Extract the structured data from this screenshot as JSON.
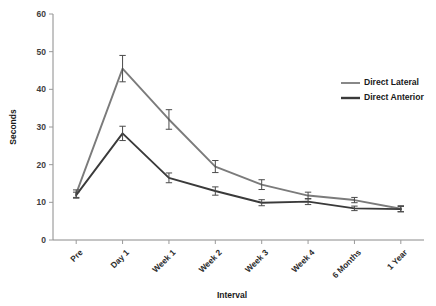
{
  "chart_data": {
    "type": "line",
    "title": "",
    "xlabel": "Interval",
    "ylabel": "Seconds",
    "categories": [
      "Pre",
      "Day 1",
      "Week 1",
      "Week 2",
      "Week 3",
      "Week 4",
      "6 Months",
      "1 Year"
    ],
    "ylim": [
      0,
      60
    ],
    "yticks": [
      0,
      10,
      20,
      30,
      40,
      50,
      60
    ],
    "ytick_labels": [
      "0",
      "10",
      "20",
      "30",
      "40",
      "50",
      "60"
    ],
    "grid": false,
    "legend_position": "right-top",
    "series": [
      {
        "name": "Direct Lateral",
        "color": "#7b7b7b",
        "values": [
          12.3,
          45.5,
          32.0,
          19.5,
          14.7,
          11.8,
          10.6,
          8.3
        ],
        "errors": [
          1.0,
          3.5,
          2.6,
          1.6,
          1.3,
          0.9,
          0.7,
          0.8
        ]
      },
      {
        "name": "Direct Anterior",
        "color": "#3a3a3a",
        "values": [
          11.9,
          28.3,
          16.5,
          13.0,
          9.9,
          10.2,
          8.4,
          8.2
        ],
        "errors": [
          0.8,
          1.9,
          1.3,
          1.1,
          0.8,
          0.8,
          0.6,
          0.7
        ]
      }
    ]
  },
  "legend": {
    "items": [
      {
        "label": "Direct Lateral"
      },
      {
        "label": "Direct Anterior"
      }
    ]
  },
  "axes": {
    "y_title": "Seconds",
    "x_title": "Interval"
  }
}
